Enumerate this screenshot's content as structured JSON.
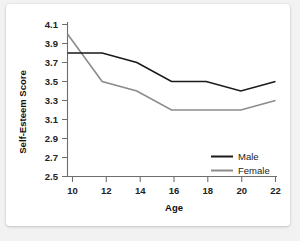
{
  "chart_data": {
    "type": "line",
    "title": "",
    "xlabel": "Age",
    "ylabel": "Self-Esteem Score",
    "x": [
      10,
      12,
      14,
      16,
      18,
      20,
      22
    ],
    "xticklabels": [
      "10",
      "12",
      "14",
      "16",
      "18",
      "20",
      "22"
    ],
    "yticks": [
      2.5,
      2.7,
      2.9,
      3.1,
      3.3,
      3.5,
      3.7,
      3.9,
      4.1
    ],
    "yticklabels": [
      "2.5",
      "2.7",
      "2.9",
      "3.1",
      "3.3",
      "3.5",
      "3.7",
      "3.9",
      "4.1"
    ],
    "xlim": [
      10,
      22
    ],
    "ylim": [
      2.5,
      4.1
    ],
    "grid": false,
    "legend_position": "lower-right",
    "series": [
      {
        "name": "Male",
        "color": "#1a1a1a",
        "values": [
          3.8,
          3.8,
          3.7,
          3.5,
          3.5,
          3.4,
          3.5
        ]
      },
      {
        "name": "Female",
        "color": "#8c8c8c",
        "values": [
          4.0,
          3.5,
          3.4,
          3.2,
          3.2,
          3.2,
          3.3
        ]
      }
    ]
  },
  "legend": {
    "entries": [
      {
        "label": "Male"
      },
      {
        "label": "Female"
      }
    ]
  },
  "colors": {
    "male_line": "#1a1a1a",
    "female_line": "#8c8c8c",
    "axis": "#6e6e6e",
    "card_background": "#ffffff",
    "page_background": "#f2f2f2"
  }
}
